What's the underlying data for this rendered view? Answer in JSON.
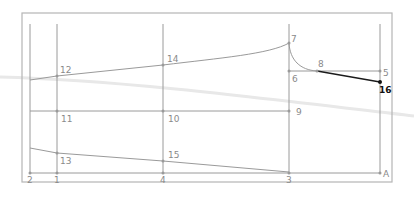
{
  "diagram": {
    "type": "pattern-draft",
    "colors": {
      "line": "#9a9a9a",
      "frame": "#b5b5b5",
      "highlight": "#1a1a1a",
      "label": "#8a8a8a",
      "artifact": "#e6e6e6"
    },
    "points": [
      {
        "id": "1",
        "label": "1",
        "x": 57,
        "y": 173
      },
      {
        "id": "2",
        "label": "2",
        "x": 30,
        "y": 173
      },
      {
        "id": "3",
        "label": "3",
        "x": 289,
        "y": 173
      },
      {
        "id": "4",
        "label": "4",
        "x": 163,
        "y": 173
      },
      {
        "id": "A",
        "label": "A",
        "x": 380,
        "y": 173
      },
      {
        "id": "5",
        "label": "5",
        "x": 380,
        "y": 71
      },
      {
        "id": "6",
        "label": "6",
        "x": 289,
        "y": 71
      },
      {
        "id": "7",
        "label": "7",
        "x": 289,
        "y": 43
      },
      {
        "id": "8",
        "label": "8",
        "x": 317,
        "y": 71
      },
      {
        "id": "9",
        "label": "9",
        "x": 289,
        "y": 111
      },
      {
        "id": "10",
        "label": "10",
        "x": 163,
        "y": 111
      },
      {
        "id": "11",
        "label": "11",
        "x": 57,
        "y": 111
      },
      {
        "id": "12",
        "label": "12",
        "x": 57,
        "y": 76
      },
      {
        "id": "13",
        "label": "13",
        "x": 57,
        "y": 153
      },
      {
        "id": "14",
        "label": "14",
        "x": 163,
        "y": 65
      },
      {
        "id": "15",
        "label": "15",
        "x": 163,
        "y": 161
      },
      {
        "id": "16",
        "label": "16",
        "x": 380,
        "y": 82
      }
    ],
    "labels": {
      "p1": "1",
      "p2": "2",
      "p3": "3",
      "p4": "4",
      "pA": "A",
      "p5": "5",
      "p6": "6",
      "p7": "7",
      "p8": "8",
      "p9": "9",
      "p10": "10",
      "p11": "11",
      "p12": "12",
      "p13": "13",
      "p14": "14",
      "p15": "15",
      "p16": "16"
    }
  }
}
